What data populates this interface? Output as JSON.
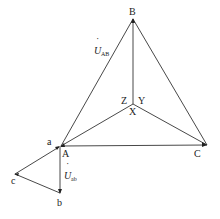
{
  "diagram": {
    "type": "phasor-diagram",
    "colors": {
      "line": "#333333",
      "text": "#222222",
      "background": "#ffffff"
    },
    "points": {
      "B": {
        "label": "B",
        "x": 133,
        "y": 19
      },
      "A": {
        "label": "A",
        "x": 61,
        "y": 146
      },
      "C": {
        "label": "C",
        "x": 207,
        "y": 145
      },
      "X": {
        "label": "X",
        "x": 133,
        "y": 104
      },
      "Y": {
        "label": "Y"
      },
      "Z": {
        "label": "Z"
      },
      "a": {
        "label": "a",
        "x": 57,
        "y": 146
      },
      "b": {
        "label": "b",
        "x": 60,
        "y": 193
      },
      "c": {
        "label": "c",
        "x": 15,
        "y": 174
      }
    },
    "vectors": [
      {
        "name": "U_AB",
        "label_main": "U",
        "label_sub": "AB",
        "dot": "˙"
      },
      {
        "name": "U_ab",
        "label_main": "U",
        "label_sub": "ab",
        "dot": "˙"
      }
    ]
  }
}
